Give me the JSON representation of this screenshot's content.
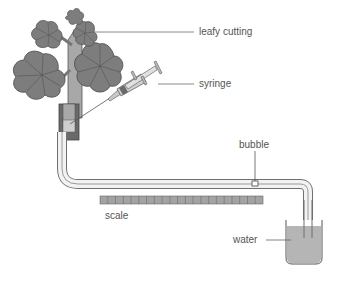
{
  "diagram": {
    "labels": {
      "leafy_cutting": "leafy cutting",
      "syringe": "syringe",
      "bubble": "bubble",
      "scale": "scale",
      "water": "water"
    },
    "scale_segments": 21,
    "colors": {
      "leaf_fill": "#7d7d7d",
      "leaf_stroke": "#4a4a4a",
      "stem_fill": "#a8a8a8",
      "tube_outline": "#6f6f6f",
      "tube_inner": "#f2f2f2",
      "water_fill": "#b5b5b5",
      "scale_fill": "#a3a3a3",
      "label_line": "#8a8a8a",
      "text": "#555555"
    }
  }
}
